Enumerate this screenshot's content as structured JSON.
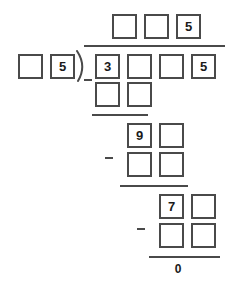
{
  "worksheet": {
    "type": "long-division",
    "title": "Long division with blank answer boxes",
    "colors": {
      "box_border": "#4a4a4a",
      "rule": "#4a4a4a",
      "text": "#1a1a1a",
      "background": "#ffffff"
    },
    "quotient": {
      "label": "quotient",
      "boxes": [
        {
          "value": "",
          "filled": false
        },
        {
          "value": "",
          "filled": false
        },
        {
          "value": "5",
          "filled": true
        }
      ]
    },
    "divisor": {
      "label": "divisor",
      "boxes": [
        {
          "value": "",
          "filled": false
        },
        {
          "value": "5",
          "filled": true
        }
      ]
    },
    "dividend": {
      "label": "dividend",
      "boxes": [
        {
          "value": "3",
          "filled": true
        },
        {
          "value": "",
          "filled": false
        },
        {
          "value": "",
          "filled": false
        },
        {
          "value": "5",
          "filled": true
        }
      ]
    },
    "steps": [
      {
        "step": 1,
        "operator": "−",
        "subtrahend": [
          {
            "value": "",
            "filled": false
          },
          {
            "value": "",
            "filled": false
          }
        ],
        "remainder": [
          {
            "value": "9",
            "filled": true
          },
          {
            "value": "",
            "filled": false
          }
        ]
      },
      {
        "step": 2,
        "operator": "−",
        "subtrahend": [
          {
            "value": "",
            "filled": false
          },
          {
            "value": "",
            "filled": false
          }
        ],
        "remainder": [
          {
            "value": "7",
            "filled": true
          },
          {
            "value": "",
            "filled": false
          }
        ]
      },
      {
        "step": 3,
        "operator": "−",
        "subtrahend": [
          {
            "value": "",
            "filled": false
          },
          {
            "value": "",
            "filled": false
          }
        ],
        "remainder": []
      }
    ],
    "final_remainder": "0"
  }
}
